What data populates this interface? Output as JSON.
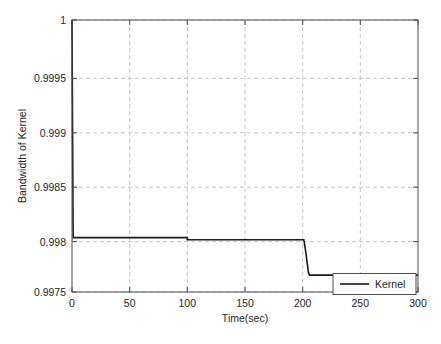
{
  "chart_data": {
    "type": "line",
    "title": "",
    "xlabel": "Time(sec)",
    "ylabel": "Bandwidth of Kernel",
    "xlim": [
      0,
      300
    ],
    "ylim": [
      0.9975,
      1
    ],
    "xticks": [
      0,
      50,
      100,
      150,
      200,
      250,
      300
    ],
    "xtick_labels": [
      "0",
      "50",
      "100",
      "150",
      "200",
      "250",
      "300"
    ],
    "yticks": [
      0.9975,
      0.998,
      0.9985,
      0.999,
      0.9995,
      1
    ],
    "ytick_labels": [
      "0.9975",
      "0.998",
      "0.9985",
      "0.999",
      "0.9995",
      "1"
    ],
    "grid": true,
    "grid_style": "dashed",
    "grid_color": "#bfbfbf",
    "legend_position": "bottom-right",
    "series": [
      {
        "name": "Kernel",
        "color": "#1a1a1a",
        "line_width": 1.6,
        "x": [
          0,
          1,
          100,
          100,
          201,
          202,
          203,
          204,
          205,
          206,
          300
        ],
        "values": [
          1,
          0.998,
          0.998,
          0.99798,
          0.99798,
          0.99792,
          0.99784,
          0.99776,
          0.99768,
          0.997655,
          0.997655
        ]
      }
    ],
    "annotations": []
  },
  "legend": {
    "entries": [
      {
        "label": "Kernel",
        "color": "#1a1a1a"
      }
    ]
  },
  "axis": {
    "x_title": "Time(sec)",
    "y_title": "Bandwidth of Kernel",
    "x_ticks": [
      "0",
      "50",
      "100",
      "150",
      "200",
      "250",
      "300"
    ],
    "y_ticks": [
      "1",
      "0.9995",
      "0.999",
      "0.9985",
      "0.998",
      "0.9975"
    ]
  }
}
